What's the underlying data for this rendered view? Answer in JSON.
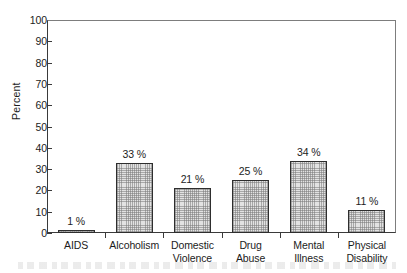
{
  "chart_data": {
    "type": "bar",
    "title": "",
    "xlabel": "",
    "ylabel": "Percent",
    "ylim": [
      0,
      100
    ],
    "y_ticks": [
      0,
      10,
      20,
      30,
      40,
      50,
      60,
      70,
      80,
      90,
      100
    ],
    "y_tick_labels": [
      "0",
      "10",
      "20",
      "30",
      "40",
      "50",
      "60",
      "70",
      "80",
      "90",
      "100"
    ],
    "grid": false,
    "legend": null,
    "categories": [
      "AIDS",
      "Alcoholism",
      "Domestic Violence",
      "Drug Abuse",
      "Mental Illness",
      "Physical Disability"
    ],
    "category_lines": [
      [
        "AIDS",
        ""
      ],
      [
        "Alcoholism",
        ""
      ],
      [
        "Domestic",
        "Violence"
      ],
      [
        "Drug",
        "Abuse"
      ],
      [
        "Mental",
        "Illness"
      ],
      [
        "Physical",
        "Disability"
      ]
    ],
    "values": [
      1,
      33,
      21,
      25,
      34,
      11
    ],
    "value_labels": [
      "1 %",
      "33 %",
      "21 %",
      "25 %",
      "34 %",
      "11 %"
    ],
    "bar_fill": "#e2e2e2",
    "bar_edge": "#2e2e2e",
    "axis_color": "#3a3a3a"
  }
}
